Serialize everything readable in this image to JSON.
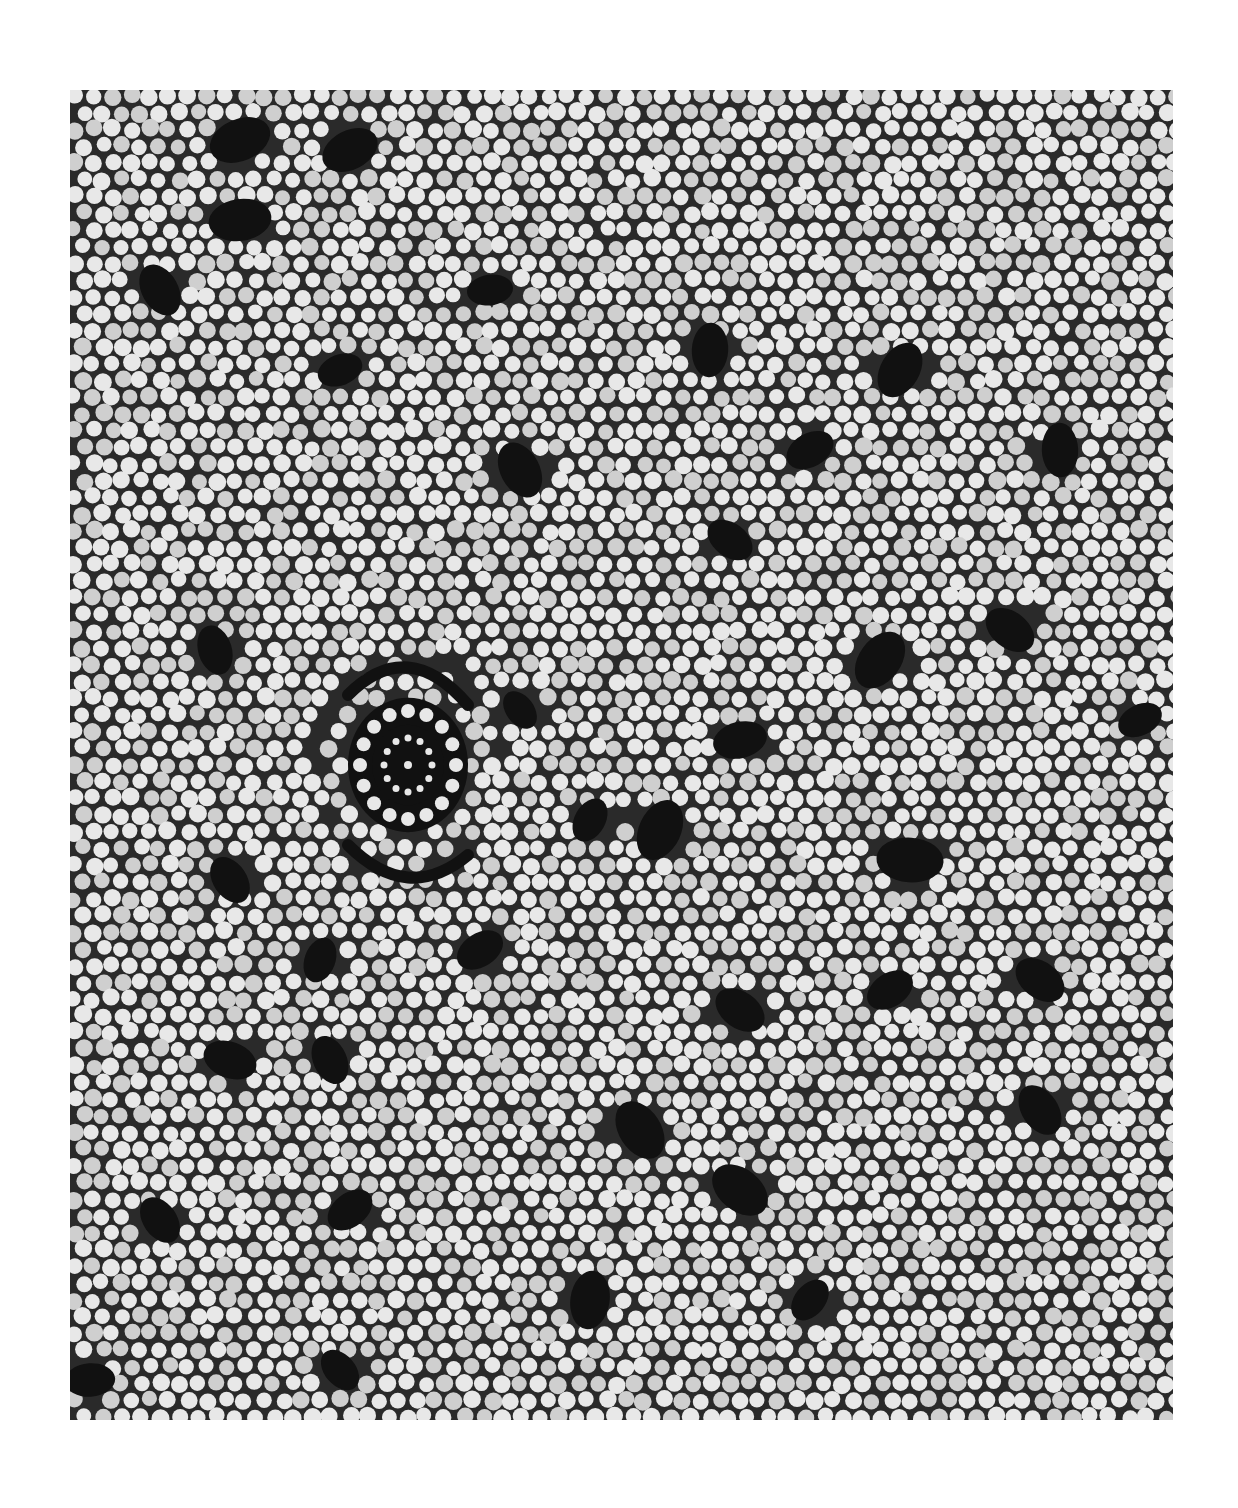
{
  "artwork": {
    "style": "dot painting",
    "palette": {
      "page_background": "#ffffff",
      "ground": "#2a2a2a",
      "dot": "#e8e8e8",
      "dot_shade": "#cfcfcf",
      "motif": "#111111"
    },
    "frame": {
      "x": 70,
      "y": 90,
      "width": 1103,
      "height": 1330
    },
    "concentric_circle": {
      "cx": 408,
      "cy": 765,
      "rings": 3
    },
    "motifs": [
      {
        "x": 240,
        "y": 140,
        "r": 30
      },
      {
        "x": 350,
        "y": 150,
        "r": 28
      },
      {
        "x": 160,
        "y": 290,
        "r": 26
      },
      {
        "x": 240,
        "y": 220,
        "r": 30
      },
      {
        "x": 340,
        "y": 370,
        "r": 22
      },
      {
        "x": 490,
        "y": 290,
        "r": 22
      },
      {
        "x": 520,
        "y": 470,
        "r": 28
      },
      {
        "x": 710,
        "y": 350,
        "r": 26
      },
      {
        "x": 900,
        "y": 370,
        "r": 28
      },
      {
        "x": 810,
        "y": 450,
        "r": 24
      },
      {
        "x": 1060,
        "y": 450,
        "r": 26
      },
      {
        "x": 730,
        "y": 540,
        "r": 24
      },
      {
        "x": 1010,
        "y": 630,
        "r": 26
      },
      {
        "x": 880,
        "y": 660,
        "r": 30
      },
      {
        "x": 1140,
        "y": 720,
        "r": 22
      },
      {
        "x": 740,
        "y": 740,
        "r": 26
      },
      {
        "x": 520,
        "y": 710,
        "r": 20
      },
      {
        "x": 215,
        "y": 650,
        "r": 24
      },
      {
        "x": 660,
        "y": 830,
        "r": 30
      },
      {
        "x": 910,
        "y": 860,
        "r": 32
      },
      {
        "x": 590,
        "y": 820,
        "r": 22
      },
      {
        "x": 230,
        "y": 880,
        "r": 24
      },
      {
        "x": 320,
        "y": 960,
        "r": 22
      },
      {
        "x": 480,
        "y": 950,
        "r": 24
      },
      {
        "x": 740,
        "y": 1010,
        "r": 26
      },
      {
        "x": 890,
        "y": 990,
        "r": 24
      },
      {
        "x": 1040,
        "y": 980,
        "r": 26
      },
      {
        "x": 230,
        "y": 1060,
        "r": 26
      },
      {
        "x": 330,
        "y": 1060,
        "r": 24
      },
      {
        "x": 640,
        "y": 1130,
        "r": 30
      },
      {
        "x": 740,
        "y": 1190,
        "r": 30
      },
      {
        "x": 1040,
        "y": 1110,
        "r": 26
      },
      {
        "x": 160,
        "y": 1220,
        "r": 24
      },
      {
        "x": 350,
        "y": 1210,
        "r": 24
      },
      {
        "x": 590,
        "y": 1300,
        "r": 28
      },
      {
        "x": 810,
        "y": 1300,
        "r": 22
      },
      {
        "x": 90,
        "y": 1380,
        "r": 24
      },
      {
        "x": 340,
        "y": 1370,
        "r": 22
      }
    ],
    "dot_spacing": 19,
    "dot_radius": 8.2
  }
}
